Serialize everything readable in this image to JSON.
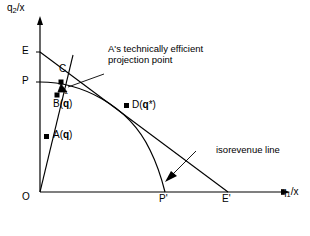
{
  "figure": {
    "background_color": "#ffffff",
    "line_color": "#000000",
    "text_color": "#000000"
  },
  "axes": {
    "y_label": "q",
    "y_label_sub": "2",
    "y_label_tail": "/x",
    "y_label_full": "q2/x",
    "x_label": "q",
    "x_label_sub": "1",
    "x_label_tail": "/x",
    "x_label_full": "q1/x",
    "origin_label": "O"
  },
  "axis_marks": {
    "y_upper": "E",
    "y_lower": "P",
    "x_inner": "P'",
    "x_outer": "E'"
  },
  "points": [
    {
      "id": "C",
      "label": "C",
      "label_kind": "plain"
    },
    {
      "id": "B",
      "label": "B(q̂)",
      "label_prefix": "B(",
      "label_var": "q",
      "label_accent": "ˆ",
      "label_suffix": ")"
    },
    {
      "id": "A",
      "label": "A(q)",
      "label_prefix": "A(",
      "label_var": "q",
      "label_suffix": ")"
    },
    {
      "id": "D",
      "label": "D(q*)",
      "label_prefix": "D(",
      "label_var": "q",
      "label_suffix": "*)"
    }
  ],
  "annotations": {
    "projection_line1": "A's technically efficient",
    "projection_line2": "projection point",
    "isorevenue": "isorevenue line"
  }
}
